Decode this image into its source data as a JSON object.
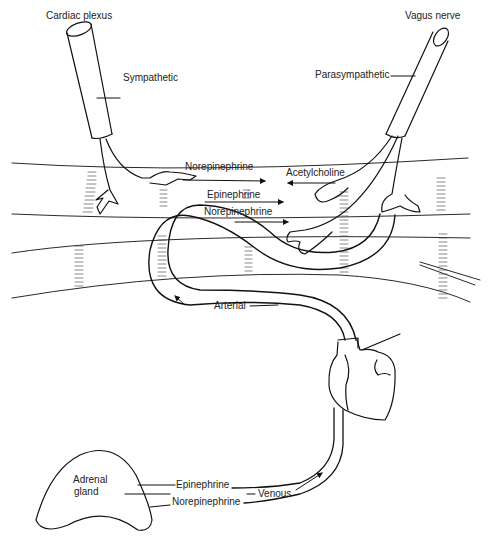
{
  "diagram": {
    "type": "neurohumoral-transmission-illustration",
    "labels": {
      "cardiac_plexus": "Cardiac plexus",
      "sympathetic": "Sympathetic",
      "vagus_nerve": "Vagus nerve",
      "parasympathetic": "Parasympathetic",
      "norepinephrine_neural": "Norepinephrine",
      "acetylcholine": "Acetylcholine",
      "epinephrine_blood": "Epinephrine",
      "norepinephrine_blood": "Norepinephrine",
      "arterial": "Arterial",
      "adrenal_gland_line1": "Adrenal",
      "adrenal_gland_line2": "gland",
      "epinephrine_adrenal": "Epinephrine",
      "norepinephrine_adrenal": "Norepinephrine",
      "venous": "Venous"
    },
    "components": [
      "sympathetic nerve (cardiac plexus)",
      "parasympathetic nerve (vagus)",
      "smooth muscle bands",
      "artery loop",
      "heart",
      "adrenal gland",
      "vein"
    ],
    "stroke_color": "#111111",
    "background": "#ffffff"
  }
}
